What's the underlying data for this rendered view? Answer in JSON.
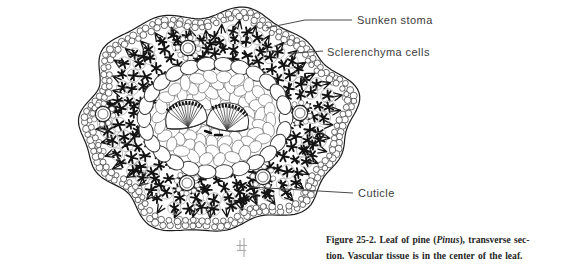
{
  "figure": {
    "labels": {
      "sunken_stoma": "Sunken stoma",
      "sclerenchyma_cells": "Sclerenchyma cells",
      "cuticle": "Cuticle"
    },
    "caption": {
      "line1_bold": "Figure 25-2.",
      "line1_pre_italic": " Leaf of pine (",
      "line1_italic": "Pinus",
      "line1_post_italic": "), transverse sec-",
      "line2": "tion. Vascular tissue is in the center of the leaf."
    }
  },
  "colors": {
    "ink": "#1c1c1c",
    "label_text": "#3c3c3c",
    "background": "#ffffff"
  }
}
